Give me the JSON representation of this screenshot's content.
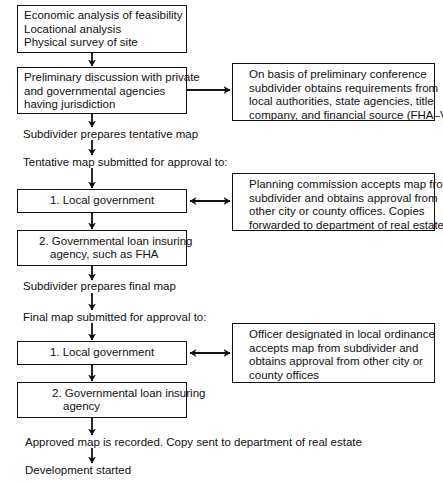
{
  "diagram": {
    "type": "flowchart",
    "boxes": {
      "feasibility": {
        "lines": [
          "Economic analysis of feasibility",
          "Locational analysis",
          "Physical survey of site"
        ]
      },
      "preliminary": {
        "lines": [
          "Preliminary discussion with private",
          "and governmental agencies",
          "having jurisdiction"
        ]
      },
      "preliminary_note": {
        "lines": [
          "On basis of preliminary conference",
          "subdivider obtains requirements from",
          "local authorities, state agencies, title",
          "company, and financial source (FHA–VA)"
        ]
      },
      "tentative_local": {
        "lines": [
          "1. Local government"
        ]
      },
      "tentative_local_note": {
        "lines": [
          "Planning commission accepts map from",
          "subdivider and obtains approval from",
          "other city or county offices.  Copies",
          "forwarded to department of real estate"
        ]
      },
      "tentative_agency": {
        "lines": [
          "2. Governmental loan insuring",
          "agency, such as FHA"
        ]
      },
      "final_local": {
        "lines": [
          "1. Local government"
        ]
      },
      "final_local_note": {
        "lines": [
          "Officer designated in local ordinance",
          "accepts map from subdivider and",
          "obtains approval from other city or",
          "county offices"
        ]
      },
      "final_agency": {
        "lines": [
          "2. Governmental loan insuring",
          "agency"
        ]
      }
    },
    "labels": {
      "tentative_prepare": "Subdivider prepares tentative map",
      "tentative_submit": "Tentative map submitted for approval to:",
      "final_prepare": "Subdivider prepares final map",
      "final_submit": "Final map submitted for approval to:",
      "recorded": "Approved map is recorded.  Copy sent to department of real estate",
      "started": "Development started"
    },
    "colors": {
      "stroke": "#111111",
      "background": "#ffffff"
    }
  }
}
